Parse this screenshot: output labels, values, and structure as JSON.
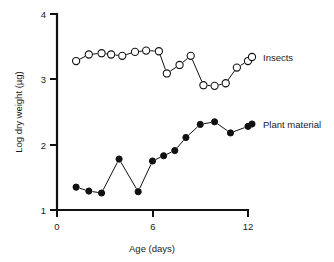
{
  "chart_data": {
    "type": "line",
    "title": "",
    "xlabel": "Age (days)",
    "ylabel": "Log dry weight (µg)",
    "xlim": [
      0,
      12.6
    ],
    "ylim": [
      1,
      4
    ],
    "xticks": [
      0,
      6,
      12
    ],
    "xticklabels": [
      "0",
      "6",
      "12"
    ],
    "yticks": [
      1,
      2,
      3,
      4
    ],
    "yticklabels": [
      "1",
      "2",
      "3",
      "4"
    ],
    "grid": false,
    "legend_position": "right-inline",
    "series": [
      {
        "name": "Insects",
        "marker": "open-circle",
        "x": [
          1.2,
          2.0,
          2.8,
          3.4,
          4.1,
          4.9,
          5.6,
          6.4,
          6.9,
          7.7,
          8.4,
          9.2,
          9.9,
          10.6,
          11.3,
          12.0
        ],
        "values": [
          3.28,
          3.38,
          3.4,
          3.38,
          3.36,
          3.42,
          3.44,
          3.43,
          3.09,
          3.22,
          3.36,
          2.91,
          2.9,
          2.94,
          3.18,
          3.28
        ]
      },
      {
        "name": "Plant material",
        "marker": "filled-circle",
        "x": [
          1.2,
          2.0,
          2.8,
          3.9,
          5.1,
          6.0,
          6.7,
          7.4,
          8.1,
          9.0,
          9.9,
          10.9,
          12.0
        ],
        "values": [
          1.35,
          1.29,
          1.26,
          1.78,
          1.28,
          1.75,
          1.83,
          1.91,
          2.11,
          2.31,
          2.35,
          2.18,
          2.28
        ]
      }
    ],
    "legend": [
      {
        "label": "Insects",
        "marker": "open-circle"
      },
      {
        "label": "Plant material",
        "marker": "filled-circle"
      }
    ],
    "colors": {
      "axis": "#111111",
      "line": "#111111",
      "marker_fill_open": "#ffffff",
      "marker_fill_closed": "#111111",
      "background": "#ffffff"
    }
  }
}
